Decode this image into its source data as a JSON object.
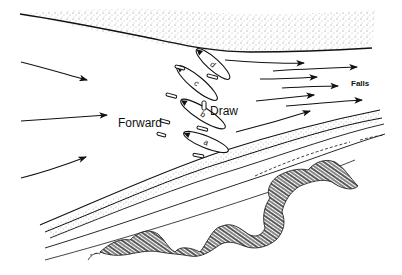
{
  "diagram": {
    "labels": {
      "forward": "Forward",
      "draw": "Draw",
      "falls": "Falls"
    },
    "canoes": [
      {
        "id": "a",
        "letter": "a"
      },
      {
        "id": "b",
        "letter": "b"
      },
      {
        "id": "c",
        "letter": "c"
      },
      {
        "id": "d",
        "letter": "d"
      }
    ],
    "elements": {
      "current_arrows_left": 3,
      "current_arrows_right": 7,
      "far_bank": "stippled sandy shoreline (top)",
      "near_bank": "layered stippled shore with brush (bottom right)"
    },
    "colors": {
      "ink": "#111111",
      "background": "#ffffff"
    }
  }
}
